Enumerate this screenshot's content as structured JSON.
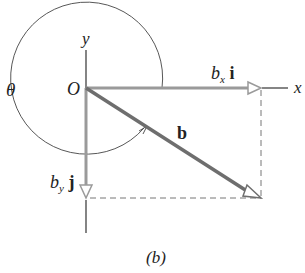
{
  "diagram": {
    "caption": "(b)",
    "labels": {
      "y_axis": "y",
      "x_axis": "x",
      "origin": "O",
      "angle": "θ",
      "vector": "b",
      "bx_base": "b",
      "bx_sub": "x",
      "bx_unit": "i",
      "by_base": "b",
      "by_sub": "y",
      "by_unit": "j"
    },
    "colors": {
      "axis": "#333333",
      "vector": "#6e6e6e",
      "component": "#9a9a9a",
      "dashed": "#777777"
    }
  }
}
